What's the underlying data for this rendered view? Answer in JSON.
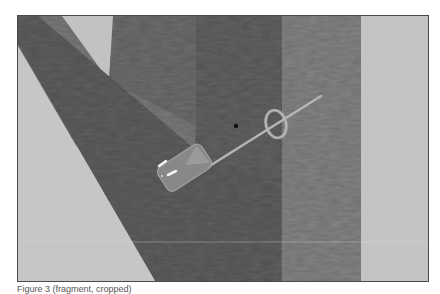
{
  "figure": {
    "type": "rendered-3d-scene",
    "colors": {
      "background_light": "#c4c4c4",
      "beam_dark": "#5f5f5f",
      "beam_mid": "#7b7b7b",
      "beam_right": "#858585",
      "needle": "#b5b5b5",
      "ring": "#b8b8b8",
      "highlight": "#f2f2f2",
      "dot": "#101010"
    }
  },
  "caption": {
    "text": "Figure 3 (fragment, cropped)"
  }
}
